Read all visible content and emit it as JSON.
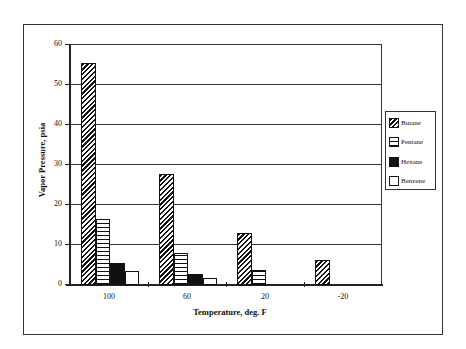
{
  "chart_data": {
    "type": "bar",
    "title": "",
    "xlabel": "Temperature, deg. F",
    "ylabel": "Vapor Pressure, psia",
    "categories": [
      "100",
      "60",
      "20",
      "-20"
    ],
    "series": [
      {
        "name": "Butane",
        "pattern": "diagonal-hatch",
        "values": [
          55.2,
          27.5,
          12.7,
          6.0
        ]
      },
      {
        "name": "Pentane",
        "pattern": "horizontal-lines",
        "values": [
          16.3,
          7.7,
          3.6,
          0
        ]
      },
      {
        "name": "Hexane",
        "pattern": "solid-black",
        "values": [
          5.3,
          2.4,
          0,
          0
        ]
      },
      {
        "name": "Benzene",
        "pattern": "white",
        "values": [
          3.2,
          1.6,
          0,
          0
        ]
      }
    ],
    "ylim": [
      0,
      60
    ],
    "yticks": [
      "0",
      "10",
      "20",
      "30",
      "40",
      "50",
      "60"
    ],
    "grid": true,
    "legend_position": "right"
  }
}
